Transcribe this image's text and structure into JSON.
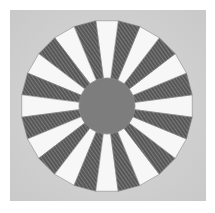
{
  "image": {
    "subject": "Dresden plate quilt block",
    "width": 215,
    "height": 213,
    "colors": {
      "page_background": "#ffffff",
      "fabric_background": "#d9d9d9",
      "fabric_background_shade": "#c9c9c9",
      "white_wedge": "#f7f7f7",
      "dark_wedge": "#575757",
      "dark_wedge_stripe": "#7a7a7a",
      "center_circle": "#7d7d7d",
      "outline": "#8a8a8a"
    },
    "block": {
      "x": 10,
      "y": 10,
      "width": 196,
      "height": 191
    },
    "plate": {
      "cx": 107,
      "cy": 106,
      "outer_radius": 86,
      "inner_radius": 28,
      "wedge_count": 24,
      "first_white_angle_deg": 0
    }
  }
}
